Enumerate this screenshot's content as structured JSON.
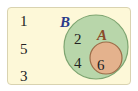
{
  "venn": {
    "universal_elements": [
      "1",
      "5",
      "3"
    ],
    "set_B": {
      "label": "B",
      "elements": [
        "2",
        "4"
      ],
      "fill": "#b5d4a8",
      "stroke": "#6e9a62"
    },
    "set_A": {
      "label": "A",
      "elements": [
        "6"
      ],
      "fill": "#e3b08a",
      "stroke": "#9a6a45"
    },
    "background": "#fdf8d8",
    "label_B_color": "#2b3a8a",
    "label_A_color": "#8a4a2a"
  }
}
